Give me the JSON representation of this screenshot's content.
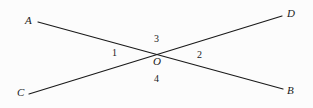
{
  "figure": {
    "background_color": "#fcfcfc",
    "stroke_color": "#1a1a1a",
    "stroke_width": 1.2,
    "width": 313,
    "height": 108,
    "points": [
      {
        "name": "A",
        "label": "A",
        "x": 38,
        "y": 22
      },
      {
        "name": "B",
        "label": "B",
        "x": 283,
        "y": 89
      },
      {
        "name": "C",
        "label": "C",
        "x": 29,
        "y": 94
      },
      {
        "name": "D",
        "label": "D",
        "x": 282,
        "y": 16
      },
      {
        "name": "O",
        "label": "O",
        "x": 156,
        "y": 53
      }
    ],
    "lines": [
      {
        "name": "line-AB",
        "from": "A",
        "to": "B",
        "x1": 38,
        "y1": 22,
        "x2": 283,
        "y2": 89
      },
      {
        "name": "line-CD",
        "from": "C",
        "to": "D",
        "x1": 29,
        "y1": 94,
        "x2": 282,
        "y2": 16
      }
    ],
    "angles": [
      {
        "name": "angle-1",
        "label": "1",
        "position": "left",
        "x": 115,
        "y": 53
      },
      {
        "name": "angle-2",
        "label": "2",
        "position": "right",
        "x": 200,
        "y": 55
      },
      {
        "name": "angle-3",
        "label": "3",
        "position": "top",
        "x": 157,
        "y": 39
      },
      {
        "name": "angle-4",
        "label": "4",
        "position": "bottom",
        "x": 157,
        "y": 79
      }
    ]
  }
}
